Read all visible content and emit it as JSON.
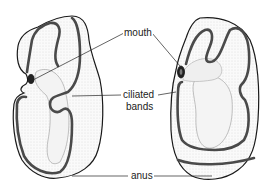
{
  "diagram": {
    "labels": {
      "mouth": "mouth",
      "ciliated_line1": "ciliated",
      "ciliated_line2": "bands",
      "anus": "anus"
    },
    "colors": {
      "outline": "#1a1a1a",
      "band": "#4a4a4a",
      "stipple": "#d8d8d8",
      "background": "#ffffff"
    }
  }
}
